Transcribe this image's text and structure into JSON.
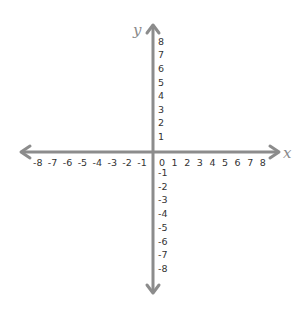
{
  "chart_data": {
    "type": "scatter",
    "title": "",
    "xlabel": "x",
    "ylabel": "y",
    "xlim": [
      -8,
      8
    ],
    "ylim": [
      -8,
      8
    ],
    "grid": false,
    "x_ticks": [
      -8,
      -7,
      -6,
      -5,
      -4,
      -3,
      -2,
      -1,
      0,
      1,
      2,
      3,
      4,
      5,
      6,
      7,
      8
    ],
    "y_ticks": [
      -8,
      -7,
      -6,
      -5,
      -4,
      -3,
      -2,
      -1,
      1,
      2,
      3,
      4,
      5,
      6,
      7,
      8
    ],
    "series": []
  },
  "colors": {
    "axis": "#8c8c8c",
    "labels": "#333333",
    "axis_names": "#8a8a8a"
  }
}
